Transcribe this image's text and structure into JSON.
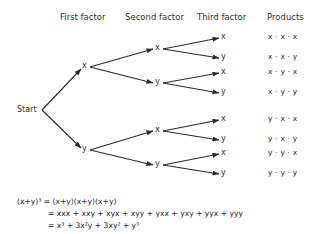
{
  "headers": {
    "first": "First factor",
    "second": "Second factor",
    "third": "Third factor",
    "products": "Products"
  },
  "tree": {
    "root": "Start",
    "level1": [
      "x",
      "y"
    ],
    "level2": [
      "x",
      "y",
      "x",
      "y"
    ],
    "level3": [
      "x",
      "y",
      "x",
      "y",
      "x",
      "y",
      "x",
      "y"
    ]
  },
  "products": [
    "x · x · x",
    "x · x · y",
    "x · y · x",
    "x · y · y",
    "y · x · x",
    "y · x · y",
    "y · y · x",
    "y · y · y"
  ],
  "equation": {
    "line1": "(x+y)³ = (x+y)(x+y)(x+y)",
    "line2": "= xxx + xxy + xyx + xyy + yxx + yxy + yyx + yyy",
    "line3": "= x³ + 3x²y + 3xy² + y³"
  },
  "colors": {
    "ink": "#2a2a2a",
    "background": "#ffffff"
  }
}
